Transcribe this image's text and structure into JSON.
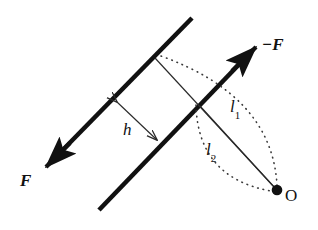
{
  "figure": {
    "type": "physics-vector-diagram",
    "width": 318,
    "height": 230,
    "background_color": "#ffffff",
    "ink_color": "#111111"
  },
  "labels": {
    "force_negative": "−F",
    "force_positive": "F",
    "perpendicular_distance": "h",
    "moment_arm_1_base": "l",
    "moment_arm_1_sub": "1",
    "moment_arm_2_base": "l",
    "moment_arm_2_sub": "2",
    "origin_point": "O"
  },
  "geometry": {
    "line_upper": {
      "name": "upper-force-line",
      "x1": 192,
      "y1": 18,
      "x2": 44,
      "y2": 169,
      "stroke_width": 4.6,
      "description": "bold line of action carrying force F toward lower-left"
    },
    "line_lower": {
      "name": "lower-force-line",
      "x1": 258,
      "y1": 45,
      "x2": 99,
      "y2": 210,
      "stroke_width": 4.6,
      "description": "bold line of action carrying force -F toward upper-right"
    },
    "arrow_force_positive": {
      "name": "force-arrow-F",
      "tip_x": 44,
      "tip_y": 169,
      "direction": "down-left"
    },
    "arrow_force_negative": {
      "name": "force-arrow-minus-F",
      "tip_x": 258,
      "tip_y": 45,
      "direction": "up-right"
    },
    "distance_h": {
      "name": "perpendicular-distance-h",
      "x1": 113,
      "y1": 98,
      "x2": 161,
      "y2": 144,
      "double_headed": true,
      "stroke_width": 1.1
    },
    "moment_arm_1": {
      "name": "moment-arm-l1",
      "x1": 155,
      "y1": 58,
      "x2": 276,
      "y2": 189,
      "stroke_width": 1.1
    },
    "moment_arm_2": {
      "name": "moment-arm-l2",
      "x1": 200,
      "y1": 106,
      "x2": 276,
      "y2": 189,
      "stroke_width": 1.1
    },
    "arc_1": {
      "name": "dotted-arc-l1",
      "x1": 160,
      "y1": 56,
      "cx": 268,
      "cy": 100,
      "x2": 277,
      "y2": 186,
      "style": "dotted"
    },
    "arc_2": {
      "name": "dotted-arc-l2",
      "x1": 196,
      "y1": 106,
      "cx": 204,
      "cy": 178,
      "x2": 272,
      "y2": 191,
      "style": "dotted"
    },
    "origin_dot": {
      "name": "origin-dot-O",
      "cx": 277,
      "cy": 190,
      "r": 5.2
    }
  },
  "colors": {
    "ink": "#111111",
    "thin_line": "#2a2a2a",
    "dotted": "#555555",
    "background": "#ffffff"
  }
}
